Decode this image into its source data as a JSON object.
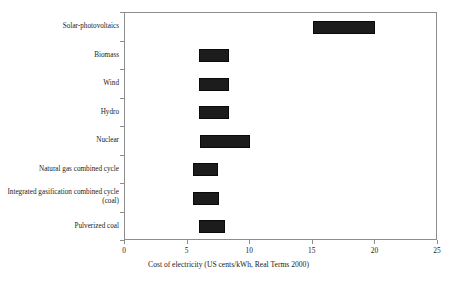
{
  "chart_data": {
    "type": "bar",
    "orientation": "horizontal",
    "range_bars": true,
    "title": "",
    "xlabel": "Cost of electricity (US cents/kWh, Real Terms 2000)",
    "ylabel": "",
    "xlim": [
      0,
      25
    ],
    "xticks": [
      0,
      5,
      10,
      15,
      20,
      25
    ],
    "xticklabels": [
      "0",
      "5",
      "10",
      "15",
      "20",
      "25"
    ],
    "grid": false,
    "legend": null,
    "bar_color": "#1c1c1c",
    "axis_color": "#8d8d8d",
    "categories": [
      "Solar-photovoltaics",
      "Biomass",
      "Wind",
      "Hydro",
      "Nuclear",
      "Natural gas combined cycle",
      "Integrated gasification combined cycle (coal)",
      "Pulverized coal"
    ],
    "series": [
      {
        "name": "Cost of electricity range",
        "units": "US cents/kWh",
        "points": [
          {
            "category": "Solar-photovoltaics",
            "low": 15.0,
            "high": 20.0
          },
          {
            "category": "Biomass",
            "low": 5.9,
            "high": 8.3
          },
          {
            "category": "Wind",
            "low": 5.9,
            "high": 8.3
          },
          {
            "category": "Hydro",
            "low": 5.9,
            "high": 8.3
          },
          {
            "category": "Nuclear",
            "low": 6.0,
            "high": 10.0
          },
          {
            "category": "Natural gas combined cycle",
            "low": 5.45,
            "high": 7.45
          },
          {
            "category": "Integrated gasification combined cycle (coal)",
            "low": 5.45,
            "high": 7.5
          },
          {
            "category": "Pulverized coal",
            "low": 5.9,
            "high": 8.0
          }
        ]
      }
    ]
  }
}
